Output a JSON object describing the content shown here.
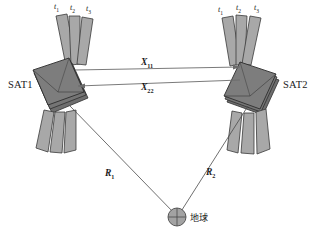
{
  "diagram": {
    "background": "#ffffff",
    "colors": {
      "panel_fill": "#a8a8a8",
      "panel_stroke": "#3a3a3a",
      "body_fill": "#7d7d7d",
      "body_fill_dark": "#6e6e6e",
      "body_stroke": "#2e2e2e",
      "line": "#6b6b6b",
      "earth_fill": "#a3a3a3",
      "text": "#1b1b1b"
    }
  },
  "satellites": [
    {
      "id": "sat1",
      "name": "SAT1",
      "panel_ticks": [
        "t",
        "t",
        "t"
      ],
      "panel_tick_subs": [
        "1",
        "2",
        "3"
      ]
    },
    {
      "id": "sat2",
      "name": "SAT2",
      "panel_ticks": [
        "t",
        "t",
        "t"
      ],
      "panel_tick_subs": [
        "1",
        "2",
        "3"
      ]
    }
  ],
  "links": [
    {
      "id": "x11",
      "symbol": "X",
      "sub": "11",
      "direction": "sat1-to-sat2"
    },
    {
      "id": "x22",
      "symbol": "X",
      "sub": "22",
      "direction": "sat2-to-sat1"
    }
  ],
  "range_vectors": [
    {
      "id": "r1",
      "symbol": "R",
      "sub": "1",
      "from": "sat1",
      "to": "earth"
    },
    {
      "id": "r2",
      "symbol": "R",
      "sub": "2",
      "from": "sat2",
      "to": "earth"
    }
  ],
  "earth": {
    "label": "地球",
    "symbol": "earth-cross-circle"
  }
}
